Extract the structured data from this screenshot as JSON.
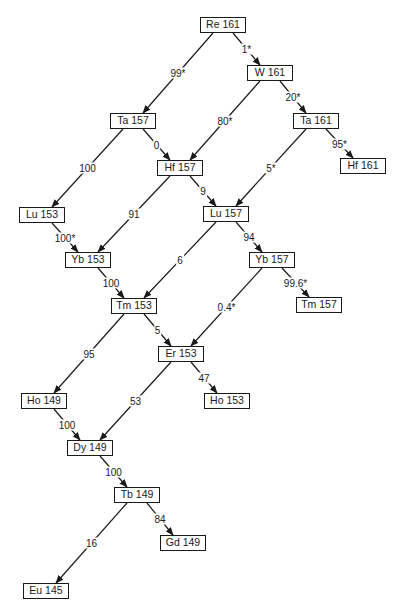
{
  "diagram": {
    "type": "decay-chain",
    "nodes": [
      {
        "id": "re161",
        "label": "Re 161",
        "x": 200,
        "y": 17
      },
      {
        "id": "w161",
        "label": "W 161",
        "x": 247,
        "y": 65
      },
      {
        "id": "ta157",
        "label": "Ta 157",
        "x": 110,
        "y": 113
      },
      {
        "id": "ta161",
        "label": "Ta 161",
        "x": 293,
        "y": 113
      },
      {
        "id": "hf157",
        "label": "Hf 157",
        "x": 157,
        "y": 160
      },
      {
        "id": "hf161",
        "label": "Hf 161",
        "x": 340,
        "y": 158
      },
      {
        "id": "lu153",
        "label": "Lu 153",
        "x": 19,
        "y": 207
      },
      {
        "id": "lu157",
        "label": "Lu 157",
        "x": 203,
        "y": 206
      },
      {
        "id": "yb153",
        "label": "Yb 153",
        "x": 65,
        "y": 252
      },
      {
        "id": "yb157",
        "label": "Yb 157",
        "x": 249,
        "y": 252
      },
      {
        "id": "tm153",
        "label": "Tm 153",
        "x": 111,
        "y": 298
      },
      {
        "id": "tm157",
        "label": "Tm 157",
        "x": 296,
        "y": 297
      },
      {
        "id": "er153",
        "label": "Er 153",
        "x": 158,
        "y": 346
      },
      {
        "id": "ho149",
        "label": "Ho 149",
        "x": 21,
        "y": 393
      },
      {
        "id": "ho153",
        "label": "Ho 153",
        "x": 204,
        "y": 393
      },
      {
        "id": "dy149",
        "label": "Dy 149",
        "x": 67,
        "y": 440
      },
      {
        "id": "tb149",
        "label": "Tb 149",
        "x": 114,
        "y": 487
      },
      {
        "id": "gd149",
        "label": "Gd 149",
        "x": 160,
        "y": 535
      },
      {
        "id": "eu145",
        "label": "Eu 145",
        "x": 23,
        "y": 583
      }
    ],
    "edges": [
      {
        "from": "re161",
        "to": "ta157",
        "label": "99*"
      },
      {
        "from": "re161",
        "to": "w161",
        "label": "1*"
      },
      {
        "from": "w161",
        "to": "hf157",
        "label": "80*"
      },
      {
        "from": "w161",
        "to": "ta161",
        "label": "20*"
      },
      {
        "from": "ta157",
        "to": "lu153",
        "label": "100"
      },
      {
        "from": "ta157",
        "to": "hf157",
        "label": "0"
      },
      {
        "from": "ta161",
        "to": "lu157",
        "label": "5*"
      },
      {
        "from": "ta161",
        "to": "hf161",
        "label": "95*"
      },
      {
        "from": "hf157",
        "to": "yb153",
        "label": "91"
      },
      {
        "from": "hf157",
        "to": "lu157",
        "label": "9"
      },
      {
        "from": "lu153",
        "to": "yb153",
        "label": "100*"
      },
      {
        "from": "lu157",
        "to": "tm153",
        "label": "6"
      },
      {
        "from": "lu157",
        "to": "yb157",
        "label": "94"
      },
      {
        "from": "yb153",
        "to": "tm153",
        "label": "100"
      },
      {
        "from": "yb157",
        "to": "er153",
        "label": "0.4*"
      },
      {
        "from": "yb157",
        "to": "tm157",
        "label": "99.6*"
      },
      {
        "from": "tm153",
        "to": "ho149",
        "label": "95"
      },
      {
        "from": "tm153",
        "to": "er153",
        "label": "5"
      },
      {
        "from": "er153",
        "to": "dy149",
        "label": "53"
      },
      {
        "from": "er153",
        "to": "ho153",
        "label": "47"
      },
      {
        "from": "ho149",
        "to": "dy149",
        "label": "100"
      },
      {
        "from": "dy149",
        "to": "tb149",
        "label": "100"
      },
      {
        "from": "tb149",
        "to": "eu145",
        "label": "16"
      },
      {
        "from": "tb149",
        "to": "gd149",
        "label": "84"
      }
    ],
    "colors": {
      "line": "#1a1a1a",
      "background": "#ffffff"
    }
  }
}
